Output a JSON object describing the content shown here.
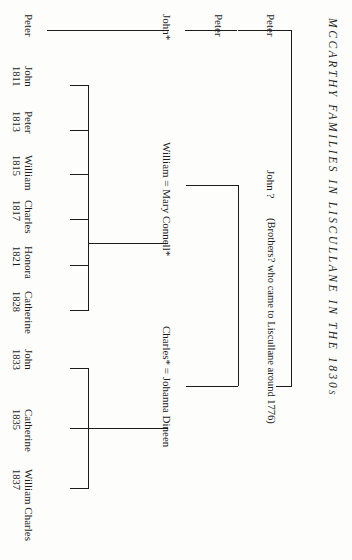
{
  "document": {
    "title": "MCCARTHY FAMILIES IN LISCULLANE IN THE 1830s",
    "type": "family-tree-genealogy-chart",
    "orientation": "rotated-90-degrees"
  },
  "generation_1": {
    "ancestors_note": "(Brothers? who came to Liscullane around 1776)",
    "people": [
      {
        "id": "g1-peter",
        "label": "Peter"
      },
      {
        "id": "g1-john",
        "label": "John ?"
      }
    ]
  },
  "generation_2": {
    "people": [
      {
        "id": "g2-peter",
        "label": "Peter"
      },
      {
        "id": "g2-john",
        "label": "John*"
      },
      {
        "id": "g2-william",
        "label": "William = Mary Connell*"
      },
      {
        "id": "g2-charles",
        "label": "Charles* = Johanna Dineen"
      }
    ]
  },
  "generation_3": {
    "peter_line": [
      {
        "name": "Peter",
        "year": ""
      }
    ],
    "john_children": [
      {
        "name": "John",
        "year": "1811"
      },
      {
        "name": "Peter",
        "year": "1813"
      },
      {
        "name": "William",
        "year": "1815"
      },
      {
        "name": "Charles",
        "year": "1817"
      },
      {
        "name": "Honora",
        "year": "1821"
      },
      {
        "name": "Catherine",
        "year": "1828"
      }
    ],
    "charles_children": [
      {
        "name": "John",
        "year": "1833"
      },
      {
        "name": "Catherine",
        "year": "1835"
      },
      {
        "name": "William Charles",
        "year": "1837"
      }
    ]
  },
  "colors": {
    "ink": "#1b1b1b",
    "paper": "#fdfdfc"
  }
}
